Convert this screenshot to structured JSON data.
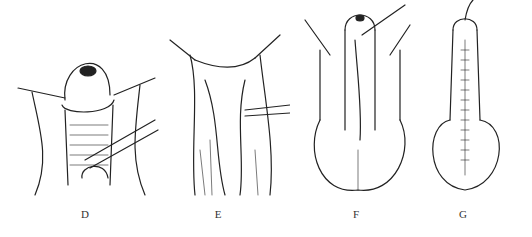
{
  "figure": {
    "panels": [
      {
        "id": "D",
        "label": "D",
        "description": "penile shaft with exposed dorsum, sutures laterally, instrument at lower right"
      },
      {
        "id": "E",
        "label": "E",
        "description": "skin flaps retracted with hooks and forceps"
      },
      {
        "id": "F",
        "label": "F",
        "description": "shaft with catheter, flaps open over scrotum"
      },
      {
        "id": "G",
        "label": "G",
        "description": "closed midline suture line over shaft and scrotum with catheter"
      }
    ]
  }
}
